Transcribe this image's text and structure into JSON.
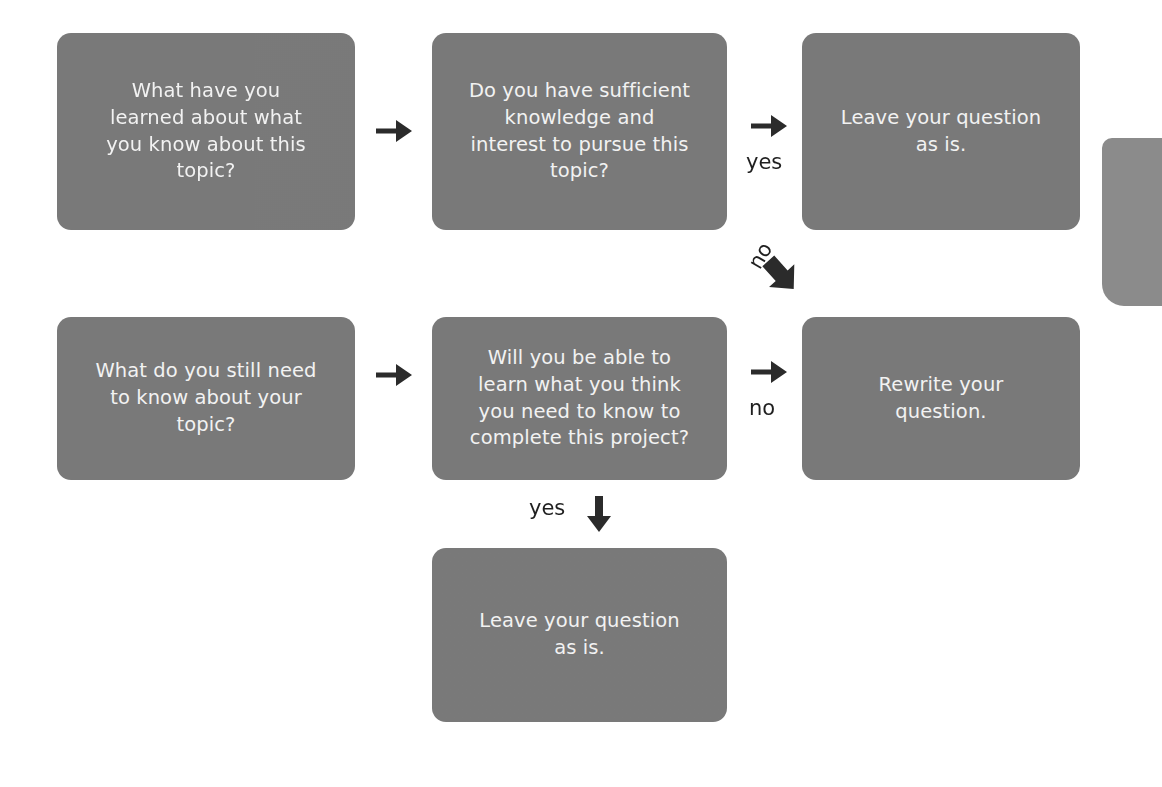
{
  "diagram": {
    "colors": {
      "node_fill": "#797979",
      "node_text": "#f2f2f2",
      "arrow": "#2b2b2b",
      "background": "#ffffff",
      "edge_partial_fill": "#8b8b8b"
    },
    "nodes": [
      {
        "id": "r1c1",
        "text": "What have you\nlearned about what\nyou know about this\ntopic?",
        "row": 1,
        "column": 1
      },
      {
        "id": "r1c2",
        "text": "Do you have sufficient\nknowledge and\ninterest to pursue this\ntopic?",
        "row": 1,
        "column": 2
      },
      {
        "id": "r1c3",
        "text": "Leave your question\nas is.",
        "row": 1,
        "column": 3
      },
      {
        "id": "r2c1",
        "text": "What do you still need\nto know about your\ntopic?",
        "row": 2,
        "column": 1
      },
      {
        "id": "r2c2",
        "text": "Will you be able to\nlearn what you think\nyou need to know to\ncomplete this project?",
        "row": 2,
        "column": 2
      },
      {
        "id": "r2c3",
        "text": "Rewrite your\nquestion.",
        "row": 2,
        "column": 3
      },
      {
        "id": "bottom",
        "text": "Leave your question\nas is.",
        "row": 3,
        "column": 2
      }
    ],
    "edges": [
      {
        "id": "r1-1to2",
        "label": "",
        "icon": "arrow-right-icon",
        "from": "r1c1",
        "to": "r1c2"
      },
      {
        "id": "r1-2to3",
        "label": "yes",
        "icon": "arrow-right-icon",
        "from": "r1c2",
        "to": "r1c3"
      },
      {
        "id": "diag-no",
        "label": "no",
        "icon": "arrow-diagonal-down-right-icon",
        "from": "r1c2",
        "to": "r2c3"
      },
      {
        "id": "r2-1to2",
        "label": "",
        "icon": "arrow-right-icon",
        "from": "r2c1",
        "to": "r2c2"
      },
      {
        "id": "r2-2to3",
        "label": "no",
        "icon": "arrow-right-icon",
        "from": "r2c2",
        "to": "r2c3"
      },
      {
        "id": "down-yes",
        "label": "yes",
        "icon": "arrow-down-icon",
        "from": "r2c2",
        "to": "bottom"
      }
    ]
  }
}
